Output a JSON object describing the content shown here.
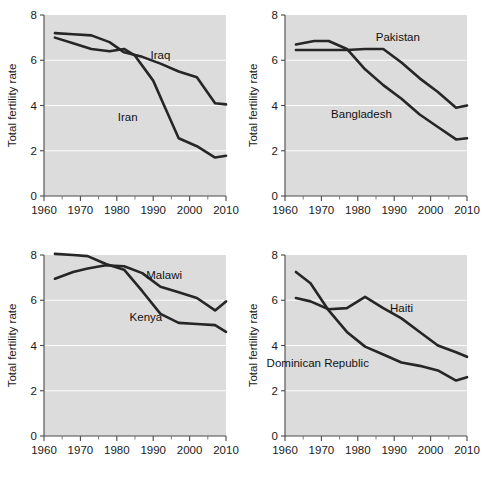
{
  "figure": {
    "width": 483,
    "height": 480,
    "background": "#ffffff",
    "plot_background": "#dcdcdc",
    "gridline_color": "#fbfbfb",
    "line_color": "#262626",
    "axis_color": "#4a4a4a",
    "panel_count": 4,
    "layout": "2x2 grid of small-multiple line charts"
  },
  "common": {
    "ylabel": "Total fertility rate",
    "xlabel": "",
    "xlim": [
      1960,
      2010
    ],
    "ylim": [
      0,
      8
    ],
    "yticks": [
      0,
      2,
      4,
      6,
      8
    ],
    "ytick_labels": [
      "0",
      "2",
      "4",
      "6",
      "8"
    ],
    "xticks": [
      1960,
      1970,
      1980,
      1990,
      2000,
      2010
    ],
    "xtick_labels": [
      "1960",
      "1970",
      "1980",
      "1990",
      "2000",
      "2010"
    ],
    "xminor_ticks": [
      1965,
      1975,
      1985,
      1995,
      2005
    ],
    "grid": "horizontal white gridlines at y = 2, 4, 6",
    "legend_position": "inline labels next to each series"
  },
  "chart_data": [
    {
      "type": "line",
      "panel": "top-left",
      "title": "",
      "xlabel": "",
      "ylabel": "Total fertility rate",
      "xlim": [
        1960,
        2010
      ],
      "ylim": [
        0,
        8
      ],
      "xticks": [
        1960,
        1970,
        1980,
        1990,
        2000,
        2010
      ],
      "yticks": [
        0,
        2,
        4,
        6,
        8
      ],
      "grid": true,
      "legend_position": "inline",
      "series": [
        {
          "name": "Iraq",
          "label_x": 1992,
          "label_y": 6.05,
          "x": [
            1963,
            1968,
            1973,
            1978,
            1982,
            1987,
            1992,
            1997,
            2002,
            2007,
            2010
          ],
          "values": [
            7.2,
            7.15,
            7.1,
            6.8,
            6.35,
            6.15,
            5.85,
            5.5,
            5.25,
            4.1,
            4.05
          ]
        },
        {
          "name": "Iran",
          "label_x": 1983,
          "label_y": 3.3,
          "x": [
            1963,
            1968,
            1973,
            1978,
            1982,
            1985,
            1990,
            1993,
            1997,
            2002,
            2007,
            2010
          ],
          "values": [
            7.0,
            6.75,
            6.5,
            6.4,
            6.5,
            6.2,
            5.1,
            4.0,
            2.55,
            2.2,
            1.7,
            1.78
          ]
        }
      ]
    },
    {
      "type": "line",
      "panel": "top-right",
      "title": "",
      "xlabel": "",
      "ylabel": "Total fertility rate",
      "xlim": [
        1960,
        2010
      ],
      "ylim": [
        0,
        8
      ],
      "xticks": [
        1960,
        1970,
        1980,
        1990,
        2000,
        2010
      ],
      "yticks": [
        0,
        2,
        4,
        6,
        8
      ],
      "grid": true,
      "legend_position": "inline",
      "series": [
        {
          "name": "Pakistan",
          "label_x": 1991,
          "label_y": 6.85,
          "x": [
            1963,
            1968,
            1972,
            1977,
            1982,
            1987,
            1992,
            1997,
            2002,
            2007,
            2010
          ],
          "values": [
            6.45,
            6.45,
            6.45,
            6.45,
            6.5,
            6.5,
            5.9,
            5.2,
            4.6,
            3.9,
            4.0
          ]
        },
        {
          "name": "Bangladesh",
          "label_x": 1981,
          "label_y": 3.45,
          "x": [
            1963,
            1968,
            1972,
            1977,
            1982,
            1987,
            1992,
            1997,
            2002,
            2007,
            2010
          ],
          "values": [
            6.7,
            6.85,
            6.85,
            6.5,
            5.6,
            4.9,
            4.3,
            3.6,
            3.05,
            2.5,
            2.55
          ]
        }
      ]
    },
    {
      "type": "line",
      "panel": "bottom-left",
      "title": "",
      "xlabel": "",
      "ylabel": "Total fertility rate",
      "xlim": [
        1960,
        2010
      ],
      "ylim": [
        0,
        8
      ],
      "xticks": [
        1960,
        1970,
        1980,
        1990,
        2000,
        2010
      ],
      "yticks": [
        0,
        2,
        4,
        6,
        8
      ],
      "grid": true,
      "legend_position": "inline",
      "series": [
        {
          "name": "Malawi",
          "label_x": 1993,
          "label_y": 6.95,
          "x": [
            1963,
            1968,
            1972,
            1977,
            1982,
            1987,
            1992,
            1997,
            2002,
            2007,
            2010
          ],
          "values": [
            6.95,
            7.25,
            7.4,
            7.55,
            7.5,
            7.2,
            6.6,
            6.35,
            6.1,
            5.55,
            5.95
          ]
        },
        {
          "name": "Kenya",
          "label_x": 1988,
          "label_y": 5.1,
          "x": [
            1963,
            1968,
            1972,
            1977,
            1982,
            1987,
            1992,
            1997,
            2002,
            2007,
            2010
          ],
          "values": [
            8.05,
            8.0,
            7.95,
            7.6,
            7.35,
            6.4,
            5.4,
            5.0,
            4.95,
            4.9,
            4.6
          ]
        }
      ]
    },
    {
      "type": "line",
      "panel": "bottom-right",
      "title": "",
      "xlabel": "",
      "ylabel": "Total fertility rate",
      "xlim": [
        1960,
        2010
      ],
      "ylim": [
        0,
        8
      ],
      "xticks": [
        1960,
        1970,
        1980,
        1990,
        2000,
        2010
      ],
      "yticks": [
        0,
        2,
        4,
        6,
        8
      ],
      "grid": true,
      "legend_position": "inline",
      "series": [
        {
          "name": "Haiti",
          "label_x": 1992,
          "label_y": 5.5,
          "x": [
            1963,
            1967,
            1972,
            1977,
            1982,
            1987,
            1992,
            1997,
            2002,
            2007,
            2010
          ],
          "values": [
            6.1,
            5.95,
            5.6,
            5.65,
            6.15,
            5.65,
            5.2,
            4.6,
            4.0,
            3.7,
            3.5
          ]
        },
        {
          "name": "Dominican Republic",
          "label_x": 1969,
          "label_y": 3.05,
          "x": [
            1963,
            1967,
            1972,
            1977,
            1982,
            1987,
            1992,
            1997,
            2002,
            2007,
            2010
          ],
          "values": [
            7.25,
            6.75,
            5.55,
            4.6,
            3.95,
            3.6,
            3.25,
            3.1,
            2.9,
            2.45,
            2.6
          ]
        }
      ]
    }
  ]
}
